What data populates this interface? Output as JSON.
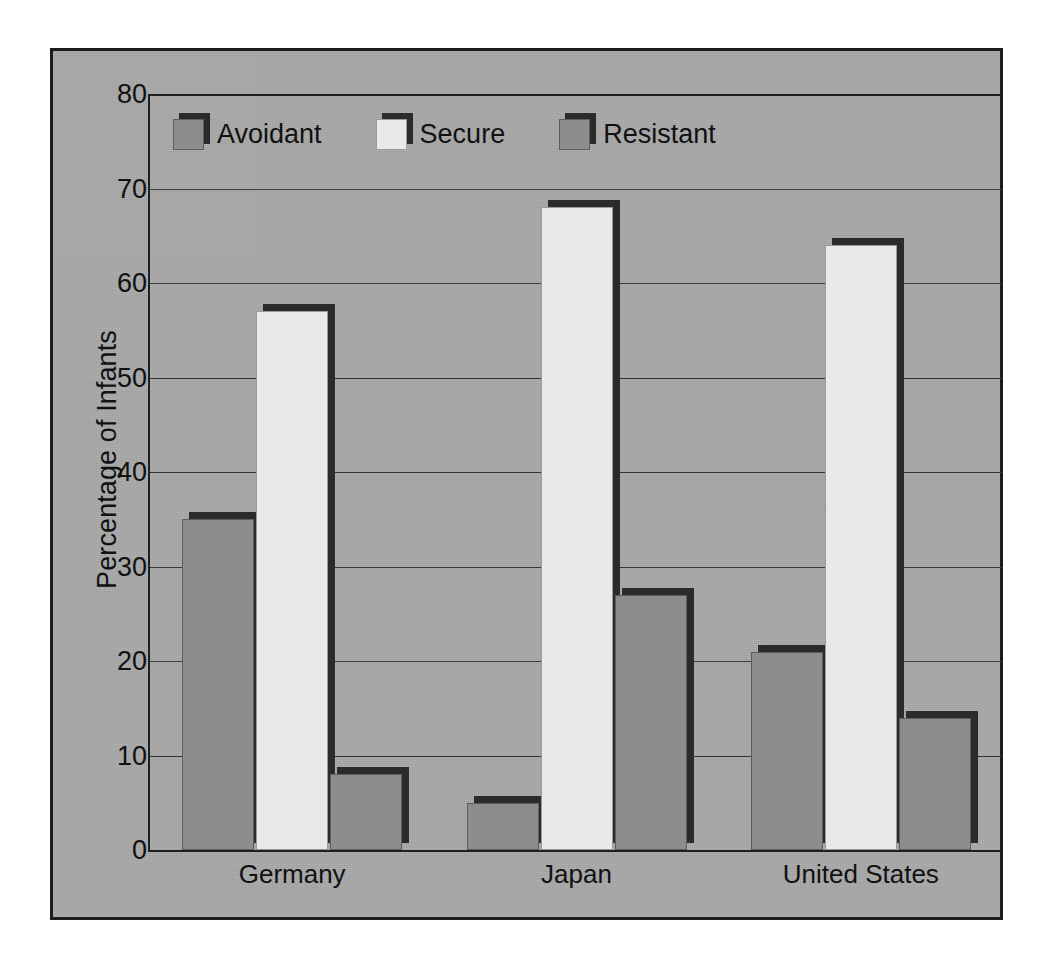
{
  "chart_data": {
    "type": "bar",
    "title": "",
    "xlabel": "",
    "ylabel": "Percentage of Infants",
    "categories": [
      "Germany",
      "Japan",
      "United States"
    ],
    "series": [
      {
        "name": "Avoidant",
        "values": [
          35,
          5,
          21
        ],
        "color": "#8d8d8d"
      },
      {
        "name": "Secure",
        "values": [
          57,
          68,
          64
        ],
        "color": "#e9e9e7"
      },
      {
        "name": "Resistant",
        "values": [
          8,
          27,
          14
        ],
        "color": "#8d8d8d"
      }
    ],
    "ylim": [
      0,
      80
    ],
    "ytick_values": [
      0,
      10,
      20,
      30,
      40,
      50,
      60,
      70,
      80
    ],
    "ytick_labels": [
      "0",
      "10",
      "20",
      "30",
      "40",
      "50",
      "60",
      "70",
      "80"
    ],
    "grid": true,
    "legend_position": "top-left-inside",
    "background_color": "#a9a9a9",
    "frame_color": "#1c1c1c",
    "shadow_color": "#2b2b2b"
  }
}
